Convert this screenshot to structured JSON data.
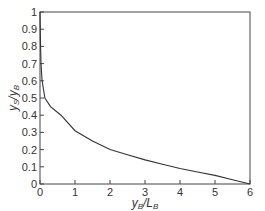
{
  "chart_data": {
    "type": "line",
    "title": "",
    "xlabel": "y_B/L_B",
    "ylabel": "y_S/y_B",
    "xlim": [
      0,
      6
    ],
    "ylim": [
      0,
      1
    ],
    "grid": false,
    "legend": null,
    "x_ticks": [
      "0",
      "1",
      "2",
      "3",
      "4",
      "5",
      "6"
    ],
    "y_ticks": [
      "0",
      "0.1",
      "0.2",
      "0.3",
      "0.4",
      "0.5",
      "0.6",
      "0.7",
      "0.8",
      "0.9",
      "1"
    ],
    "series": [
      {
        "name": "y_S/y_B",
        "color": "#333333",
        "x": [
          0,
          0.01,
          0.03,
          0.06,
          0.14,
          0.3,
          0.6,
          1.0,
          1.5,
          2.0,
          2.5,
          3.0,
          3.5,
          4.0,
          4.5,
          5.0,
          5.5,
          6.0
        ],
        "y": [
          1.0,
          0.85,
          0.7,
          0.6,
          0.5,
          0.45,
          0.4,
          0.31,
          0.25,
          0.2,
          0.17,
          0.14,
          0.115,
          0.09,
          0.07,
          0.05,
          0.025,
          0.0
        ]
      }
    ]
  },
  "labels": {
    "xlabel_main": "y",
    "xlabel_sub1": "B",
    "xlabel_sep": "/L",
    "xlabel_sub2": "B",
    "ylabel_main": "y",
    "ylabel_sub1": "S",
    "ylabel_sep": "/y",
    "ylabel_sub2": "B"
  }
}
